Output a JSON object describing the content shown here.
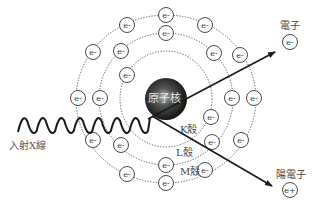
{
  "diagram": {
    "nucleus": {
      "label": "原子核",
      "cx": 166,
      "cy": 99,
      "r": 21
    },
    "center": {
      "cx": 166,
      "cy": 99
    },
    "shells": [
      {
        "name": "K",
        "label": "K殼",
        "rx": 46,
        "ry": 48
      },
      {
        "name": "L",
        "label": "L殼",
        "rx": 67,
        "ry": 66
      },
      {
        "name": "M",
        "label": "M殼",
        "rx": 90,
        "ry": 84
      }
    ],
    "electron_symbol": "e-",
    "positron_symbol": "e+",
    "electrons": [
      {
        "x": 166,
        "y": 15
      },
      {
        "x": 127,
        "y": 25
      },
      {
        "x": 205,
        "y": 25
      },
      {
        "x": 93,
        "y": 52
      },
      {
        "x": 240,
        "y": 55
      },
      {
        "x": 78,
        "y": 98
      },
      {
        "x": 254,
        "y": 98
      },
      {
        "x": 93,
        "y": 140
      },
      {
        "x": 241,
        "y": 140
      },
      {
        "x": 127,
        "y": 174
      },
      {
        "x": 205,
        "y": 170
      },
      {
        "x": 166,
        "y": 183
      },
      {
        "x": 166,
        "y": 33
      },
      {
        "x": 121,
        "y": 51
      },
      {
        "x": 214,
        "y": 53
      },
      {
        "x": 100,
        "y": 98
      },
      {
        "x": 232,
        "y": 98
      },
      {
        "x": 121,
        "y": 145
      },
      {
        "x": 212,
        "y": 142
      },
      {
        "x": 166,
        "y": 165
      },
      {
        "x": 127,
        "y": 75
      },
      {
        "x": 211,
        "y": 117
      }
    ],
    "incident_label": "入射X線",
    "electron_out": {
      "label": "電子",
      "symbol": "e-"
    },
    "positron_out": {
      "label": "陽電子",
      "symbol": "e+"
    },
    "colors": {
      "line": "#1a1a1a",
      "orbit": "#555555",
      "text": "#444444",
      "nucleus": "#111111"
    }
  }
}
